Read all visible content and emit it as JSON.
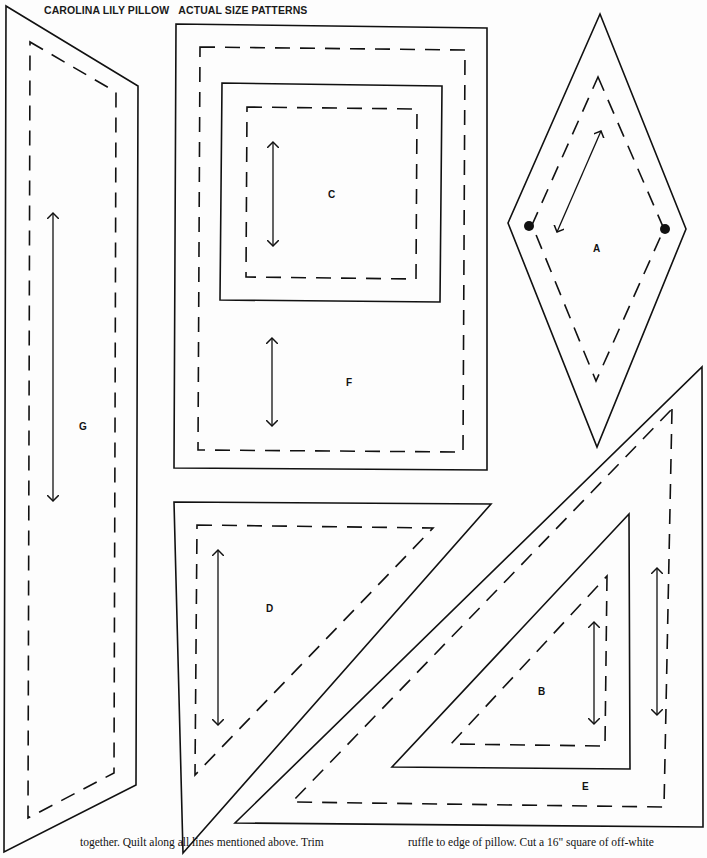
{
  "header": {
    "title": "CAROLINA LILY PILLOW",
    "subtitle": "ACTUAL SIZE PATTERNS"
  },
  "pieces": [
    {
      "id": "G",
      "label": "G",
      "shape": "parallelogram"
    },
    {
      "id": "C",
      "label": "C",
      "shape": "square"
    },
    {
      "id": "F",
      "label": "F",
      "shape": "rectangle-frame"
    },
    {
      "id": "A",
      "label": "A",
      "shape": "diamond"
    },
    {
      "id": "D",
      "label": "D",
      "shape": "right-triangle"
    },
    {
      "id": "B",
      "label": "B",
      "shape": "right-triangle"
    },
    {
      "id": "E",
      "label": "E",
      "shape": "right-triangle"
    }
  ],
  "footer": {
    "left_text": "together. Quilt along all lines mentioned above. Trim",
    "right_text": "ruffle to edge of pillow. Cut a 16\" square of off-white"
  },
  "colors": {
    "ink": "#111111",
    "paper": "#fdfdfd"
  }
}
